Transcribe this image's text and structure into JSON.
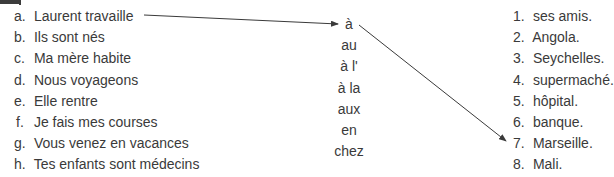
{
  "exercise": {
    "subjects": [
      {
        "letter": "a.",
        "text": "Laurent travaille"
      },
      {
        "letter": "b.",
        "text": "Ils sont nés"
      },
      {
        "letter": "c.",
        "text": "Ma mère habite"
      },
      {
        "letter": "d.",
        "text": "Nous voyageons"
      },
      {
        "letter": "e.",
        "text": "Elle rentre"
      },
      {
        "letter": "f.",
        "text": "Je fais mes courses"
      },
      {
        "letter": "g.",
        "text": "Vous venez en vacances"
      },
      {
        "letter": "h.",
        "text": "Tes enfants sont médecins"
      }
    ],
    "prepositions": [
      "à",
      "au",
      "à l'",
      "à la",
      "aux",
      "en",
      "chez"
    ],
    "places": [
      {
        "number": "1.",
        "text": "ses amis."
      },
      {
        "number": "2.",
        "text": "Angola."
      },
      {
        "number": "3.",
        "text": "Seychelles."
      },
      {
        "number": "4.",
        "text": "supermaché."
      },
      {
        "number": "5.",
        "text": "hôpital."
      },
      {
        "number": "6.",
        "text": "banque."
      },
      {
        "number": "7.",
        "text": "Marseille."
      },
      {
        "number": "8.",
        "text": "Mali."
      }
    ],
    "example_links": [
      {
        "from": "a. Laurent travaille",
        "to": "à"
      },
      {
        "from": "à",
        "to": "7. Marseille."
      }
    ],
    "line_color": "#3a3a3a"
  }
}
